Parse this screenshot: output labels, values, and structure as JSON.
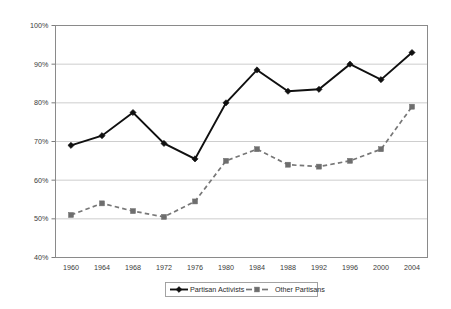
{
  "chart_data": {
    "type": "line",
    "title": "",
    "xlabel": "",
    "ylabel": "",
    "x": [
      1960,
      1964,
      1968,
      1972,
      1976,
      1980,
      1984,
      1988,
      1992,
      1996,
      2000,
      2004
    ],
    "categories": [
      "1960",
      "1964",
      "1968",
      "1972",
      "1976",
      "1980",
      "1984",
      "1988",
      "1992",
      "1996",
      "2000",
      "2004"
    ],
    "series": [
      {
        "name": "Partisan Activists",
        "marker": "diamond",
        "line_style": "solid",
        "color": "#101010",
        "values": [
          69,
          71.5,
          77.5,
          69.5,
          65.5,
          80,
          88.5,
          83,
          83.5,
          90,
          86,
          93
        ]
      },
      {
        "name": "Other Partisans",
        "marker": "square",
        "line_style": "dashed",
        "color": "#777777",
        "values": [
          51,
          54,
          52,
          50.5,
          54.5,
          65,
          68,
          64,
          63.5,
          65,
          68,
          79
        ]
      }
    ],
    "ylim": [
      40,
      100
    ],
    "ytick_values": [
      40,
      50,
      60,
      70,
      80,
      90,
      100
    ],
    "ytick_labels": [
      "40%",
      "50%",
      "60%",
      "70%",
      "80%",
      "90%",
      "100%"
    ],
    "grid": true,
    "grid_axis": "y",
    "legend_position": "bottom"
  },
  "legend": {
    "entries": [
      {
        "label": "Partisan Activists",
        "marker": "diamond-marker",
        "style": "solid"
      },
      {
        "label": "Other Partisans",
        "marker": "square-marker",
        "style": "dashed"
      }
    ]
  }
}
